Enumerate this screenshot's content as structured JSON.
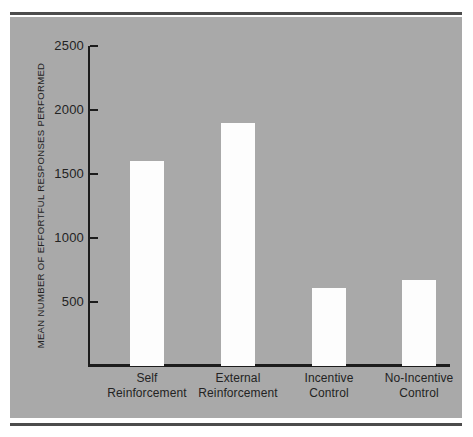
{
  "chart_data": {
    "type": "bar",
    "title": "",
    "subtitle": "",
    "xlabel": "",
    "ylabel": "MEAN NUMBER OF EFFORTFUL RESPONSES PERFORMED",
    "categories": [
      "Self Reinforcement",
      "External Reinforcement",
      "Incentive Control",
      "No-Incentive Control"
    ],
    "category_lines": [
      {
        "line1": "Self",
        "line2": "Reinforcement"
      },
      {
        "line1": "External",
        "line2": "Reinforcement"
      },
      {
        "line1": "Incentive",
        "line2": "Control"
      },
      {
        "line1": "No-Incentive",
        "line2": "Control"
      }
    ],
    "values": [
      1600,
      1900,
      610,
      670
    ],
    "ylim": [
      0,
      2500
    ],
    "yticks": [
      500,
      1000,
      1500,
      2000,
      2500
    ],
    "ytick_labels": [
      "500",
      "1000",
      "1500",
      "2000",
      "2500"
    ],
    "grid": false,
    "legend": null,
    "legend_position": "none",
    "series": [
      {
        "name": "Mean number of effortful responses performed",
        "values": [
          1600,
          1900,
          610,
          670
        ]
      }
    ]
  },
  "style": {
    "panel_color": "#a9a9a9",
    "bar_color": "#fdfdfd",
    "axis_color": "#1c1c1c",
    "rule_color": "#4c4c4c",
    "text_color": "#232323",
    "page_color": "#ffffff"
  }
}
